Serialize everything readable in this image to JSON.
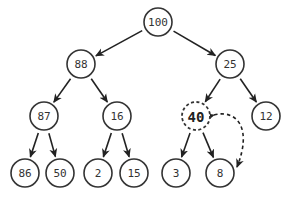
{
  "diagram": {
    "type": "binary-heap-tree",
    "nodes": [
      {
        "id": "n100",
        "label": "100",
        "style": "normal"
      },
      {
        "id": "n88",
        "label": "88",
        "style": "normal"
      },
      {
        "id": "n25",
        "label": "25",
        "style": "normal"
      },
      {
        "id": "n87",
        "label": "87",
        "style": "normal"
      },
      {
        "id": "n16",
        "label": "16",
        "style": "normal"
      },
      {
        "id": "n40",
        "label": "40",
        "style": "dashed-highlight"
      },
      {
        "id": "n12",
        "label": "12",
        "style": "normal"
      },
      {
        "id": "n86",
        "label": "86",
        "style": "normal"
      },
      {
        "id": "n50",
        "label": "50",
        "style": "normal"
      },
      {
        "id": "n2",
        "label": "2",
        "style": "normal"
      },
      {
        "id": "n15",
        "label": "15",
        "style": "normal"
      },
      {
        "id": "n3",
        "label": "3",
        "style": "normal"
      },
      {
        "id": "n8",
        "label": "8",
        "style": "normal"
      }
    ],
    "edges": [
      {
        "from": "n100",
        "to": "n88"
      },
      {
        "from": "n100",
        "to": "n25"
      },
      {
        "from": "n88",
        "to": "n87"
      },
      {
        "from": "n88",
        "to": "n16"
      },
      {
        "from": "n25",
        "to": "n40"
      },
      {
        "from": "n25",
        "to": "n12"
      },
      {
        "from": "n87",
        "to": "n86"
      },
      {
        "from": "n87",
        "to": "n50"
      },
      {
        "from": "n16",
        "to": "n2"
      },
      {
        "from": "n16",
        "to": "n15"
      },
      {
        "from": "n40",
        "to": "n3"
      },
      {
        "from": "n40",
        "to": "n8"
      }
    ],
    "swap_arrow": {
      "between": [
        "n40",
        "n8"
      ],
      "style": "dashed",
      "bidirectional": true
    }
  }
}
